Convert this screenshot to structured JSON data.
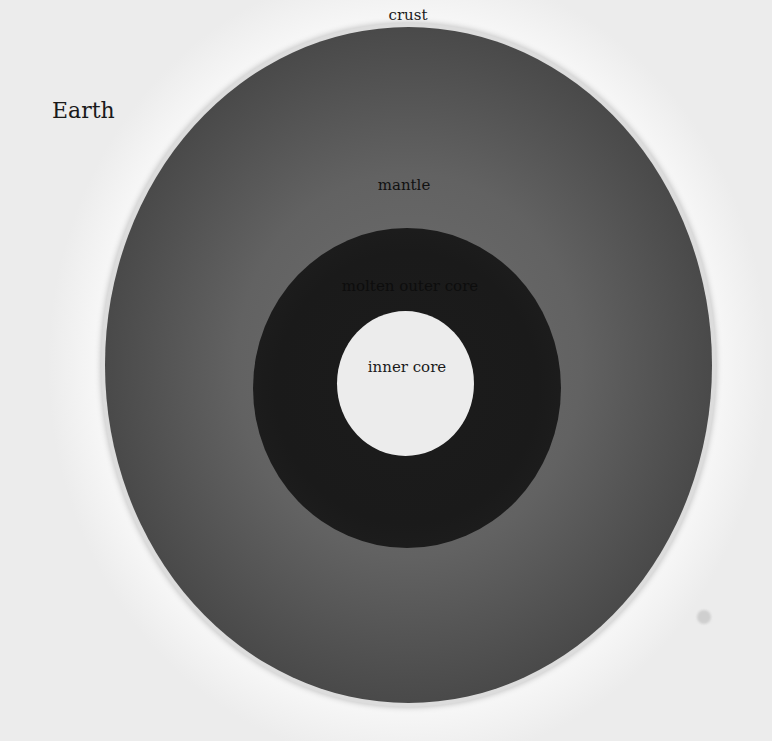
{
  "title": "Earth",
  "layers": {
    "crust": "crust",
    "mantle": "mantle",
    "outer_core": "molten outer core",
    "inner_core": "inner core"
  },
  "colors": {
    "background": "#f7f7f7",
    "crust": "#dcdcdc",
    "mantle": "#5a5a5a",
    "outer_core": "#1c1c1c",
    "inner_core": "#ececec",
    "text": "#1a1a1a"
  }
}
